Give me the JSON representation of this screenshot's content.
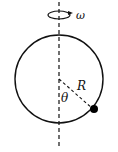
{
  "diagram": {
    "type": "physics-diagram",
    "labels": {
      "angular_velocity": "ω",
      "radius": "R",
      "angle": "θ"
    },
    "elements": {
      "axis": "vertical dashed rotation axis",
      "rotation_indicator": "ellipse with arrow showing rotation",
      "hoop": "circle",
      "radius_line": "dashed line from center to bead",
      "bead": "filled black dot on hoop"
    },
    "colors": {
      "stroke": "#111111",
      "bead": "#000000",
      "background": "#ffffff"
    }
  }
}
